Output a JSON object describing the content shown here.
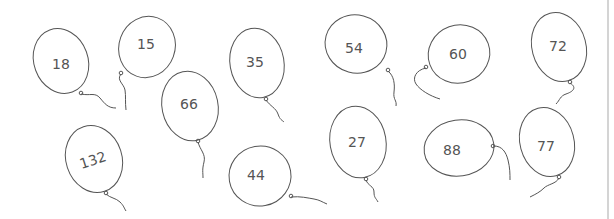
{
  "colors": {
    "outline": "#555555",
    "text": "#555555",
    "background": "#ffffff",
    "border": "#d4d4d4"
  },
  "balloons": [
    {
      "value": "18"
    },
    {
      "value": "15"
    },
    {
      "value": "66"
    },
    {
      "value": "35"
    },
    {
      "value": "54"
    },
    {
      "value": "60"
    },
    {
      "value": "72"
    },
    {
      "value": "132"
    },
    {
      "value": "44"
    },
    {
      "value": "27"
    },
    {
      "value": "88"
    },
    {
      "value": "77"
    }
  ]
}
